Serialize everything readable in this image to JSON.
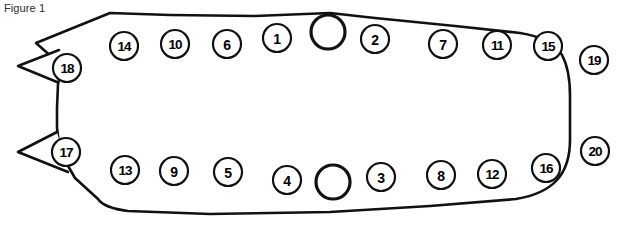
{
  "figure": {
    "caption": "Figure 1",
    "title": "Figure 1",
    "stroke_color": "#111111",
    "fill_color": "#ffffff",
    "text_color": "#000000",
    "caption_color": "#2b2b2b",
    "width": 642,
    "height": 225
  },
  "outline": {
    "description": "irregular gasket / valve cover plan outline with two notches on left edge",
    "path": "M 36 43 L 110 13 L 170 15 L 255 16 L 330 13 L 375 18 L 455 26 L 520 33 C 540 36 556 44 562 55 C 568 66 570 80 570 96 L 570 140 C 570 156 566 170 557 180 C 548 190 534 196 516 199 L 430 206 L 330 212 L 210 214 L 128 211 C 112 209 102 205 98 199 L 75 178 L 60 152 L 57 128 L 57 108 L 58 84 L 62 66 Z",
    "notches": [
      {
        "name": "upper-left-notch",
        "apex_x": 18,
        "apex_y": 66
      },
      {
        "name": "lower-left-notch",
        "apex_x": 18,
        "apex_y": 152
      }
    ]
  },
  "center_holes": [
    {
      "name": "top-center-hole",
      "cx": 328,
      "cy": 32,
      "r": 17
    },
    {
      "name": "bottom-center-hole",
      "cx": 333,
      "cy": 182,
      "r": 17
    }
  ],
  "bolts": [
    {
      "number": "1",
      "cx": 277,
      "cy": 38,
      "r": 14
    },
    {
      "number": "2",
      "cx": 375,
      "cy": 39,
      "r": 14
    },
    {
      "number": "3",
      "cx": 381,
      "cy": 177,
      "r": 14
    },
    {
      "number": "4",
      "cx": 287,
      "cy": 180,
      "r": 14
    },
    {
      "number": "5",
      "cx": 228,
      "cy": 172,
      "r": 14
    },
    {
      "number": "6",
      "cx": 227,
      "cy": 44,
      "r": 14
    },
    {
      "number": "7",
      "cx": 443,
      "cy": 44,
      "r": 14
    },
    {
      "number": "8",
      "cx": 441,
      "cy": 175,
      "r": 14
    },
    {
      "number": "9",
      "cx": 174,
      "cy": 171,
      "r": 14
    },
    {
      "number": "10",
      "cx": 175,
      "cy": 44,
      "r": 14
    },
    {
      "number": "11",
      "cx": 497,
      "cy": 45,
      "r": 14
    },
    {
      "number": "12",
      "cx": 492,
      "cy": 174,
      "r": 14
    },
    {
      "number": "13",
      "cx": 125,
      "cy": 170,
      "r": 14
    },
    {
      "number": "14",
      "cx": 124,
      "cy": 46,
      "r": 14
    },
    {
      "number": "15",
      "cx": 548,
      "cy": 46,
      "r": 14
    },
    {
      "number": "16",
      "cx": 546,
      "cy": 168,
      "r": 14
    },
    {
      "number": "17",
      "cx": 66,
      "cy": 152,
      "r": 14
    },
    {
      "number": "18",
      "cx": 67,
      "cy": 68,
      "r": 14
    },
    {
      "number": "19",
      "cx": 594,
      "cy": 60,
      "r": 14
    },
    {
      "number": "20",
      "cx": 595,
      "cy": 151,
      "r": 14
    }
  ]
}
